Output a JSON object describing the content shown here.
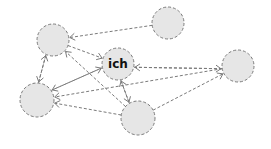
{
  "diagram": {
    "type": "network",
    "nodes": [
      {
        "id": "n1",
        "label": "",
        "x": 53,
        "y": 40,
        "r": 16
      },
      {
        "id": "n2",
        "label": "",
        "x": 168,
        "y": 23,
        "r": 16
      },
      {
        "id": "ich",
        "label": "ich",
        "x": 118,
        "y": 64,
        "r": 16
      },
      {
        "id": "n4",
        "label": "",
        "x": 238,
        "y": 66,
        "r": 16
      },
      {
        "id": "n5",
        "label": "",
        "x": 37,
        "y": 100,
        "r": 17
      },
      {
        "id": "n6",
        "label": "",
        "x": 138,
        "y": 118,
        "r": 17
      }
    ],
    "edges": [
      {
        "from": "n2",
        "to": "n1"
      },
      {
        "from": "n1",
        "to": "ich"
      },
      {
        "from": "n1",
        "to": "n5"
      },
      {
        "from": "n5",
        "to": "n1"
      },
      {
        "from": "n6",
        "to": "n1"
      },
      {
        "from": "ich",
        "to": "n4"
      },
      {
        "from": "n4",
        "to": "ich"
      },
      {
        "from": "n5",
        "to": "ich"
      },
      {
        "from": "ich",
        "to": "n5"
      },
      {
        "from": "n4",
        "to": "n5"
      },
      {
        "from": "n6",
        "to": "n5"
      },
      {
        "from": "ich",
        "to": "n6"
      },
      {
        "from": "n6",
        "to": "ich"
      },
      {
        "from": "n6",
        "to": "n4"
      }
    ],
    "colors": {
      "node_fill": "#e6e6e6",
      "stroke": "#7a7a7a",
      "text": "#111111"
    }
  }
}
